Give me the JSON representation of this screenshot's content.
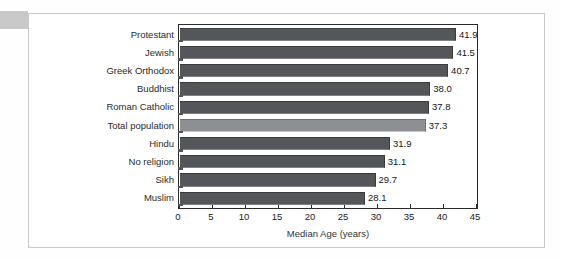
{
  "figure": {
    "card_background": "#ffffff",
    "card_border_color": "#c8c8c8",
    "corner_tab_color": "#c9c9c9"
  },
  "chart_data": {
    "type": "bar",
    "orientation": "horizontal",
    "title": "",
    "xlabel": "Median Age (years)",
    "ylabel": "",
    "xlim": [
      0,
      45
    ],
    "xticks": [
      0,
      5,
      10,
      15,
      20,
      25,
      30,
      35,
      40,
      45
    ],
    "xtick_labels": [
      "0",
      "5",
      "10",
      "15",
      "20",
      "25",
      "30",
      "35",
      "40",
      "45"
    ],
    "grid": false,
    "legend": "none",
    "categories": [
      "Protestant",
      "Jewish",
      "Greek Orthodox",
      "Buddhist",
      "Roman Catholic",
      "Total population",
      "Hindu",
      "No religion",
      "Sikh",
      "Muslim"
    ],
    "values": [
      41.9,
      41.5,
      40.7,
      38.0,
      37.8,
      37.3,
      31.9,
      31.1,
      29.7,
      28.1
    ],
    "value_labels": [
      "41.9",
      "41.5",
      "40.7",
      "38.0",
      "37.8",
      "37.3",
      "31.9",
      "31.1",
      "29.7",
      "28.1"
    ],
    "highlight_index": 5,
    "bar_color": "#555659",
    "highlight_color": "#8d8f92",
    "frame_color": "#2b2b2b"
  }
}
